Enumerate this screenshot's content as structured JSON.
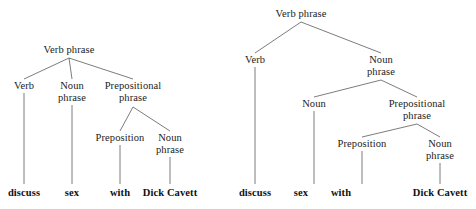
{
  "figure": {
    "kind": "syntax-tree-pair",
    "background_color": "#ffffff",
    "text_color": "#222222",
    "line_color": "#5a5a5a"
  },
  "labels": {
    "verb_phrase": "Verb phrase",
    "verb": "Verb",
    "noun_phrase": "Noun\nphrase",
    "noun": "Noun",
    "prepositional_phrase": "Prepositional\nphrase",
    "preposition": "Preposition"
  },
  "terminals": {
    "discuss": "discuss",
    "sex": "sex",
    "with": "with",
    "dick_cavett": "Dick Cavett"
  },
  "left_tree": {
    "name": "flat-vp-structure",
    "nodes": {
      "root": "Verb phrase",
      "verb": "Verb",
      "noun_phrase": "Noun\nphrase",
      "prepositional_phrase": "Prepositional\nphrase",
      "preposition": "Preposition",
      "pp_noun_phrase": "Noun\nphrase"
    },
    "terminals": [
      "discuss",
      "sex",
      "with",
      "Dick Cavett"
    ]
  },
  "right_tree": {
    "name": "nested-np-structure",
    "nodes": {
      "root": "Verb phrase",
      "verb": "Verb",
      "noun_phrase": "Noun\nphrase",
      "noun": "Noun",
      "prepositional_phrase": "Prepositional\nphrase",
      "preposition": "Preposition",
      "pp_noun_phrase": "Noun\nphrase"
    },
    "terminals": [
      "discuss",
      "sex",
      "with",
      "Dick Cavett"
    ]
  }
}
